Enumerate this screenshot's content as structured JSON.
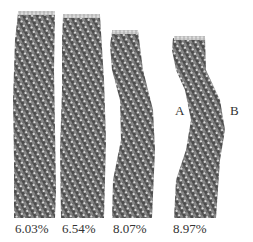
{
  "figure": {
    "panels": [
      {
        "strain_label": "6.03%"
      },
      {
        "strain_label": "6.54%"
      },
      {
        "strain_label": "8.07%"
      },
      {
        "strain_label": "8.97%"
      }
    ],
    "points": {
      "a": "A",
      "b": "B"
    },
    "colors": {
      "atom_dark": "#4a4a4a",
      "atom_mid": "#7a7a7a",
      "atom_light": "#e6e6e6",
      "text": "#333333"
    }
  }
}
